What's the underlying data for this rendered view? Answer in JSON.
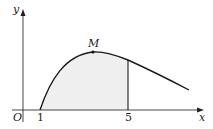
{
  "figure": {
    "axes": {
      "x_label": "x",
      "y_label": "y",
      "origin_label": "O"
    },
    "ticks": {
      "x1": "1",
      "x5": "5"
    },
    "point": {
      "label": "M"
    },
    "colors": {
      "stroke": "#1a1a1a",
      "fill": "#efefef"
    }
  }
}
